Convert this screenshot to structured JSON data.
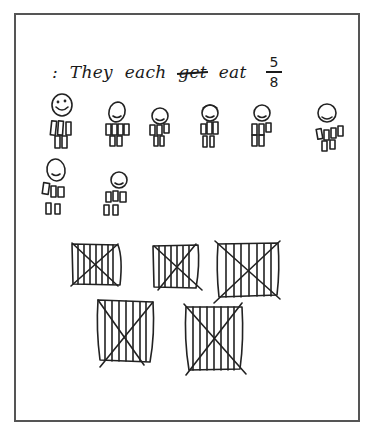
{
  "caption": {
    "prefix": ":",
    "words": [
      "They",
      "each"
    ],
    "struck_word": "get",
    "final_word": "eat",
    "fraction": {
      "numerator": "5",
      "denominator": "8"
    }
  },
  "figures": {
    "count": 8,
    "rows": [
      {
        "row": 1,
        "count": 6
      },
      {
        "row": 2,
        "count": 2
      }
    ]
  },
  "pizzas": {
    "count": 5,
    "rows": [
      {
        "row": 1,
        "count": 3
      },
      {
        "row": 2,
        "count": 2
      }
    ],
    "marking": "crossed-out, vertically sliced"
  },
  "colors": {
    "ink": "#222222",
    "frame": "#555555",
    "paper": "#ffffff"
  }
}
